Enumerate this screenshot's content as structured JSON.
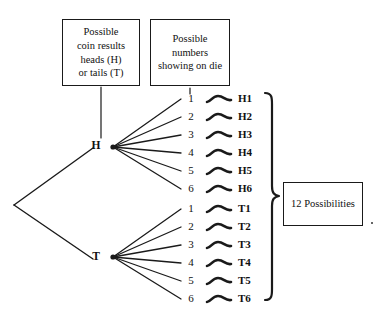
{
  "diagram": {
    "title_boxes": {
      "coin": {
        "lines": [
          "Possible",
          "coin results",
          "heads (H)",
          "or tails (T)"
        ]
      },
      "die": {
        "lines": [
          "Possible",
          "numbers",
          "showing on die"
        ]
      },
      "result": {
        "label": "12 Possibilities"
      }
    },
    "root": {
      "label": ""
    },
    "branches": [
      {
        "node_label": "H",
        "children": [
          {
            "die": "1",
            "outcome": "H1"
          },
          {
            "die": "2",
            "outcome": "H2"
          },
          {
            "die": "3",
            "outcome": "H3"
          },
          {
            "die": "4",
            "outcome": "H4"
          },
          {
            "die": "5",
            "outcome": "H5"
          },
          {
            "die": "6",
            "outcome": "H6"
          }
        ]
      },
      {
        "node_label": "T",
        "children": [
          {
            "die": "1",
            "outcome": "T1"
          },
          {
            "die": "2",
            "outcome": "T2"
          },
          {
            "die": "3",
            "outcome": "T3"
          },
          {
            "die": "4",
            "outcome": "T4"
          },
          {
            "die": "5",
            "outcome": "T5"
          },
          {
            "die": "6",
            "outcome": "T6"
          }
        ]
      }
    ],
    "colors": {
      "ink": "#1a1a1a",
      "background": "#ffffff"
    }
  }
}
